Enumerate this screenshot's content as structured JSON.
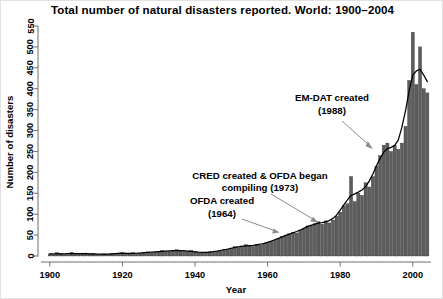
{
  "title": "Total number of natural disasters reported. World: 1900–2004",
  "axes": {
    "x_label": "Year",
    "y_label": "Number of disasters",
    "x_ticks": [
      "1900",
      "1920",
      "1940",
      "1960",
      "1980",
      "2000"
    ],
    "y_ticks": [
      "0",
      "50",
      "100",
      "150",
      "200",
      "250",
      "300",
      "350",
      "400",
      "450",
      "500",
      "550"
    ]
  },
  "annotations": [
    {
      "id": "emdat",
      "line1": "EM-DAT created",
      "line2": "(1988)",
      "year": 1988
    },
    {
      "id": "cred",
      "line1": "CRED created & OFDA began",
      "line2": "compiling (1973)",
      "year": 1973
    },
    {
      "id": "ofda",
      "line1": "OFDA created",
      "line2": "(1964)",
      "year": 1964
    }
  ],
  "colors": {
    "bar_fill": "#5d5d5d",
    "bar_edge": "#2f2f2f",
    "curve": "#000000",
    "axis": "#6e6e6e",
    "leader": "#8b8b8b",
    "background": "#ffffff"
  },
  "chart_data": {
    "type": "bar",
    "title": "Total number of natural disasters reported. World: 1900–2004",
    "xlabel": "Year",
    "ylabel": "Number of disasters",
    "xlim": [
      1900,
      2004
    ],
    "ylim": [
      0,
      550
    ],
    "xtick_values": [
      1900,
      1920,
      1940,
      1960,
      1980,
      2000
    ],
    "ytick_values": [
      0,
      50,
      100,
      150,
      200,
      250,
      300,
      350,
      400,
      450,
      500,
      550
    ],
    "grid": false,
    "legend": null,
    "overlay": {
      "type": "line",
      "name": "smoothed trend"
    },
    "categories": [
      1900,
      1901,
      1902,
      1903,
      1904,
      1905,
      1906,
      1907,
      1908,
      1909,
      1910,
      1911,
      1912,
      1913,
      1914,
      1915,
      1916,
      1917,
      1918,
      1919,
      1920,
      1921,
      1922,
      1923,
      1924,
      1925,
      1926,
      1927,
      1928,
      1929,
      1930,
      1931,
      1932,
      1933,
      1934,
      1935,
      1936,
      1937,
      1938,
      1939,
      1940,
      1941,
      1942,
      1943,
      1944,
      1945,
      1946,
      1947,
      1948,
      1949,
      1950,
      1951,
      1952,
      1953,
      1954,
      1955,
      1956,
      1957,
      1958,
      1959,
      1960,
      1961,
      1962,
      1963,
      1964,
      1965,
      1966,
      1967,
      1968,
      1969,
      1970,
      1971,
      1972,
      1973,
      1974,
      1975,
      1976,
      1977,
      1978,
      1979,
      1980,
      1981,
      1982,
      1983,
      1984,
      1985,
      1986,
      1987,
      1988,
      1989,
      1990,
      1991,
      1992,
      1993,
      1994,
      1995,
      1996,
      1997,
      1998,
      1999,
      2000,
      2001,
      2002,
      2003,
      2004
    ],
    "values": [
      5,
      3,
      8,
      6,
      3,
      4,
      9,
      6,
      5,
      5,
      7,
      5,
      6,
      4,
      3,
      5,
      4,
      5,
      6,
      7,
      8,
      6,
      5,
      8,
      5,
      6,
      9,
      10,
      7,
      9,
      11,
      13,
      10,
      11,
      14,
      15,
      12,
      13,
      11,
      13,
      10,
      8,
      7,
      9,
      10,
      9,
      11,
      13,
      16,
      15,
      19,
      22,
      20,
      24,
      27,
      25,
      23,
      28,
      26,
      30,
      33,
      35,
      38,
      42,
      46,
      50,
      53,
      57,
      55,
      62,
      66,
      72,
      74,
      77,
      82,
      76,
      84,
      79,
      86,
      95,
      105,
      120,
      125,
      190,
      130,
      150,
      145,
      175,
      165,
      190,
      215,
      240,
      265,
      270,
      250,
      265,
      255,
      270,
      310,
      420,
      535,
      410,
      500,
      400,
      390
    ]
  }
}
